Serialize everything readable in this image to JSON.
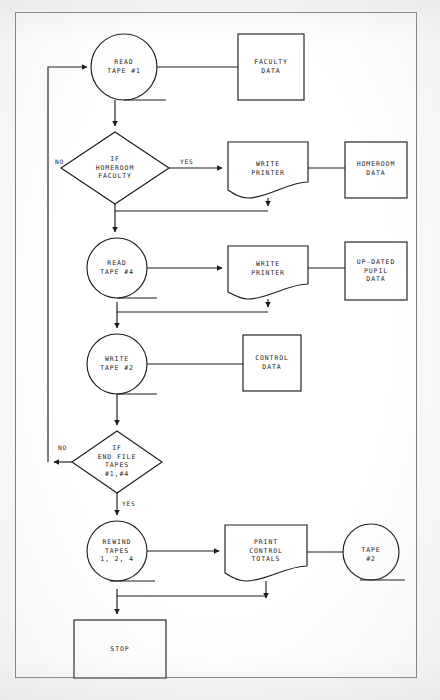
{
  "diagram": {
    "line_color": "#1c1c1c",
    "border_color": "#7e7c79",
    "page_background": "#fbfbfa"
  },
  "nodes": {
    "read_tape_1": {
      "label": "READ\nTAPE #1",
      "shape": "tape",
      "cx": 124,
      "cy": 67,
      "r": 33
    },
    "faculty_data": {
      "label": "FACULTY\nDATA",
      "shape": "rect",
      "x": 238,
      "y": 34,
      "w": 66,
      "h": 66
    },
    "if_homeroom": {
      "label": "IF\nHOMEROOM\nFACULTY",
      "shape": "diamond",
      "cx": 115,
      "cy": 168,
      "w": 108,
      "h": 72
    },
    "write_printer_1": {
      "label": "WRITE\nPRINTER",
      "shape": "document",
      "x": 228,
      "y": 142,
      "w": 80,
      "h": 56
    },
    "homeroom_data": {
      "label": "HOMEROOM\nDATA",
      "shape": "rect",
      "x": 345,
      "y": 142,
      "w": 62,
      "h": 56
    },
    "read_tape_4": {
      "label": "READ\nTAPE #4",
      "shape": "tape",
      "cx": 117,
      "cy": 268,
      "r": 30
    },
    "write_printer_2": {
      "label": "WRITE\nPRINTER",
      "shape": "document",
      "x": 228,
      "y": 246,
      "w": 80,
      "h": 52
    },
    "updated_pupil": {
      "label": "UP-DATED\nPUPIL\nDATA",
      "shape": "rect",
      "x": 345,
      "y": 242,
      "w": 62,
      "h": 58
    },
    "write_tape_2": {
      "label": "WRITE\nTAPE #2",
      "shape": "tape",
      "cx": 117,
      "cy": 364,
      "r": 30
    },
    "control_data": {
      "label": "CONTROL\nDATA",
      "shape": "rect",
      "x": 243,
      "y": 335,
      "w": 58,
      "h": 56
    },
    "if_end_file": {
      "label": "IF\nEND FILE\nTAPES\n#1,#4",
      "shape": "diamond",
      "cx": 117,
      "cy": 462,
      "w": 90,
      "h": 62
    },
    "rewind_tapes": {
      "label": "REWIND\nTAPES\n1, 2, 4",
      "shape": "tape",
      "cx": 117,
      "cy": 551,
      "r": 30
    },
    "print_control": {
      "label": "PRINT\nCONTROL\nTOTALS",
      "shape": "document",
      "x": 225,
      "y": 525,
      "w": 82,
      "h": 56
    },
    "tape_2_output": {
      "label": "TAPE\n#2",
      "shape": "tape",
      "cx": 371,
      "cy": 552,
      "r": 28
    },
    "stop": {
      "label": "STOP",
      "shape": "rect",
      "x": 74,
      "y": 620,
      "w": 92,
      "h": 58
    }
  },
  "edge_labels": [
    {
      "name": "homeroom-no-label",
      "text": "NO",
      "x": 55,
      "y": 158
    },
    {
      "name": "homeroom-yes-label",
      "text": "YES",
      "x": 180,
      "y": 158
    },
    {
      "name": "endfile-no-label",
      "text": "NO",
      "x": 58,
      "y": 444
    },
    {
      "name": "endfile-yes-label",
      "text": "YES",
      "x": 122,
      "y": 500
    }
  ],
  "edges": [
    {
      "name": "feedback-to-read-tape-1",
      "from": "loop-return",
      "to": "read_tape_1"
    },
    {
      "name": "read-tape-1-to-faculty-data",
      "from": "read_tape_1",
      "to": "faculty_data"
    },
    {
      "name": "read-tape-1-to-if-homeroom",
      "from": "read_tape_1",
      "to": "if_homeroom"
    },
    {
      "name": "if-homeroom-yes-to-write-printer",
      "from": "if_homeroom",
      "to": "write_printer_1"
    },
    {
      "name": "write-printer-to-homeroom-data",
      "from": "write_printer_1",
      "to": "homeroom_data"
    },
    {
      "name": "merge-to-read-tape-4",
      "from": "if_homeroom",
      "to": "read_tape_4"
    },
    {
      "name": "read-tape-4-to-write-printer-2",
      "from": "read_tape_4",
      "to": "write_printer_2"
    },
    {
      "name": "write-printer-2-to-updated-pupil",
      "from": "write_printer_2",
      "to": "updated_pupil"
    },
    {
      "name": "merge-to-write-tape-2",
      "from": "read_tape_4",
      "to": "write_tape_2"
    },
    {
      "name": "write-tape-2-to-control-data",
      "from": "write_tape_2",
      "to": "control_data"
    },
    {
      "name": "write-tape-2-to-if-end-file",
      "from": "write_tape_2",
      "to": "if_end_file"
    },
    {
      "name": "if-end-file-no-to-feedback",
      "from": "if_end_file",
      "to": "loop-return"
    },
    {
      "name": "if-end-file-yes-to-rewind",
      "from": "if_end_file",
      "to": "rewind_tapes"
    },
    {
      "name": "rewind-to-print-control",
      "from": "rewind_tapes",
      "to": "print_control"
    },
    {
      "name": "print-control-to-tape-2",
      "from": "print_control",
      "to": "tape_2_output"
    },
    {
      "name": "merge-to-stop",
      "from": "rewind_tapes",
      "to": "stop"
    }
  ]
}
